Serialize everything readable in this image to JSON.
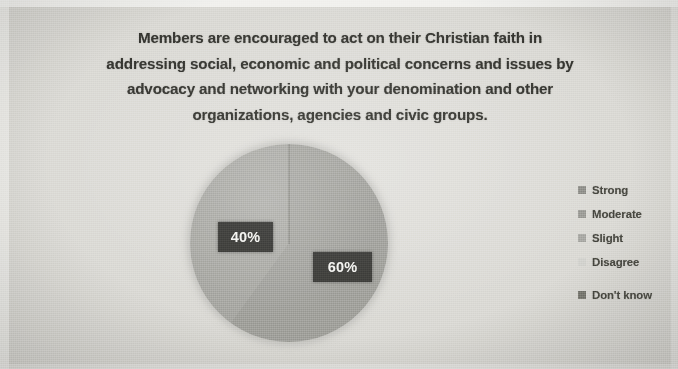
{
  "slide": {
    "title_lines": [
      "Members are encouraged to act on their Christian faith in",
      "addressing social, economic and political concerns and issues by",
      "advocacy and networking with your denomination and other",
      "organizations, agencies and civic groups."
    ]
  },
  "legend": {
    "items": [
      {
        "label": "Strong",
        "color": "#8f8f8a"
      },
      {
        "label": "Moderate",
        "color": "#9b9b96"
      },
      {
        "label": "Slight",
        "color": "#a8a8a3"
      },
      {
        "label": "Disagree",
        "color": "#d2d2ce"
      },
      {
        "label": "Don't know",
        "color": "#77776f"
      }
    ]
  },
  "datalabels": {
    "left": "40%",
    "right": "60%"
  },
  "chart_data": {
    "type": "pie",
    "categories": [
      "Strong",
      "Moderate",
      "Slight",
      "Disagree",
      "Don't know"
    ],
    "values": [
      60,
      40,
      0,
      0,
      0
    ],
    "value_labels": [
      "60%",
      "40%",
      "",
      "",
      ""
    ],
    "visible_slice_labels": [
      "60%",
      "40%"
    ],
    "unit": "percent",
    "colors": [
      "#9e9e99",
      "#a5a5a0",
      "#a8a8a3",
      "#d2d2ce",
      "#77776f"
    ],
    "legend_position": "right",
    "grid": false,
    "start_angle_deg": 0,
    "label_style": "white text on dark box"
  }
}
